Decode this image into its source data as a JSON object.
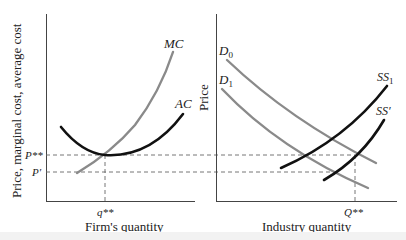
{
  "left_panel": {
    "y_axis_label": "Price, marginal cost, average cost",
    "x_axis_label": "Firm's quantity",
    "curves": {
      "mc": {
        "label": "MC",
        "color": "#8a8a8a"
      },
      "ac": {
        "label": "AC",
        "color": "#111111"
      }
    },
    "price_levels": {
      "p_star": "P**",
      "p_prime": "P′"
    },
    "quantity_marker": "q**"
  },
  "right_panel": {
    "y_axis_label": "Price",
    "x_axis_label": "Industry quantity",
    "curves": {
      "d0": {
        "label_main": "D",
        "label_sub": "0",
        "color": "#8a8a8a"
      },
      "d1": {
        "label_main": "D",
        "label_sub": "1",
        "color": "#8a8a8a"
      },
      "ss1": {
        "label_main": "SS",
        "label_sub": "1",
        "color": "#111111"
      },
      "ss_prime": {
        "label": "SS′",
        "color": "#111111"
      }
    },
    "quantity_marker": "Q**"
  },
  "style": {
    "axis_color": "#444444",
    "dash_color": "#666666"
  }
}
